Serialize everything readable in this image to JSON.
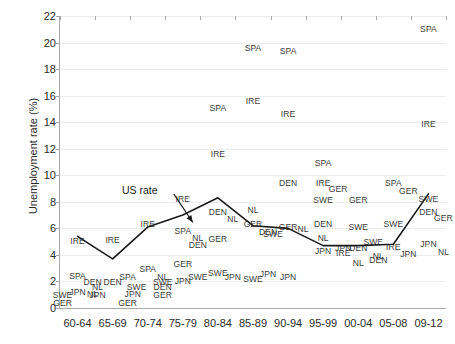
{
  "chart_data": {
    "type": "scatter",
    "title": "",
    "xlabel": "",
    "ylabel": "Unemployment rate (%)",
    "ylim": [
      0,
      22
    ],
    "ytick_step": 2,
    "yticks": [
      0,
      2,
      4,
      6,
      8,
      10,
      12,
      14,
      16,
      18,
      20,
      22
    ],
    "grid": true,
    "legend": "none",
    "categories": [
      "60-64",
      "65-69",
      "70-74",
      "75-79",
      "80-84",
      "85-89",
      "90-94",
      "95-99",
      "00-04",
      "05-08",
      "09-12"
    ],
    "annotations": [
      {
        "text": "US rate",
        "x_category": "70-74",
        "y": 8.9
      }
    ],
    "series": [
      {
        "name": "US rate",
        "type": "line",
        "color": "#1a1a1a",
        "values": [
          5.4,
          3.7,
          6.1,
          7.0,
          8.3,
          6.2,
          6.0,
          4.7,
          4.7,
          4.8,
          8.6
        ]
      },
      {
        "name": "IRE",
        "type": "scatter",
        "values": [
          5.1,
          5.2,
          6.4,
          8.2,
          11.6,
          15.6,
          14.6,
          9.4,
          4.4,
          4.6,
          13.9
        ]
      },
      {
        "name": "SPA",
        "type": "scatter",
        "values": [
          2.4,
          2.3,
          3.0,
          5.8,
          15.1,
          19.6,
          19.4,
          19.3,
          10.9,
          9.5,
          21.0
        ]
      },
      {
        "name": "GER",
        "type": "scatter",
        "values": [
          0.6,
          0.7,
          0.9,
          3.3,
          5.2,
          6.3,
          5.8,
          9.0,
          9.1,
          9.4,
          7.4
        ]
      },
      {
        "name": "DEN",
        "type": "scatter",
        "values": [
          2.0,
          1.9,
          1.5,
          5.3,
          7.2,
          6.0,
          9.4,
          6.3,
          5.0,
          3.9,
          7.2
        ]
      },
      {
        "name": "NL",
        "type": "scatter",
        "values": [
          0.9,
          1.6,
          2.2,
          5.5,
          7.0,
          7.4,
          6.1,
          5.3,
          3.4,
          4.0,
          5.2
        ]
      },
      {
        "name": "JPN",
        "type": "scatter",
        "values": [
          1.2,
          1.2,
          1.3,
          2.0,
          2.4,
          2.6,
          2.3,
          3.9,
          4.9,
          4.1,
          4.6
        ]
      },
      {
        "name": "SWE",
        "type": "scatter",
        "values": [
          1.1,
          1.8,
          2.2,
          1.9,
          2.6,
          2.2,
          6.7,
          8.9,
          6.1,
          6.4,
          8.2
        ]
      }
    ],
    "point_labels": [
      {
        "label": "IRE",
        "cat": 0,
        "y": 5.05
      },
      {
        "label": "SPA",
        "cat": 0,
        "y": 2.4
      },
      {
        "label": "DEN",
        "cat": 0,
        "y": 1.95
      },
      {
        "label": "JPN",
        "cat": 0,
        "y": 1.2
      },
      {
        "label": "NL",
        "cat": 0,
        "y": 1.05
      },
      {
        "label": "SWE",
        "cat": 0,
        "y": 0.95
      },
      {
        "label": "GER",
        "cat": 0,
        "y": 0.35
      },
      {
        "label": "IRE",
        "cat": 1,
        "y": 5.15
      },
      {
        "label": "DEN",
        "cat": 1,
        "y": 1.95
      },
      {
        "label": "SPA",
        "cat": 1,
        "y": 2.3
      },
      {
        "label": "NL",
        "cat": 1,
        "y": 1.55
      },
      {
        "label": "SWE",
        "cat": 1,
        "y": 1.55
      },
      {
        "label": "JPN",
        "cat": 1,
        "y": 0.95
      },
      {
        "label": "GER",
        "cat": 1,
        "y": 0.35
      },
      {
        "label": "IRE",
        "cat": 2,
        "y": 6.35
      },
      {
        "label": "SPA",
        "cat": 2,
        "y": 2.95
      },
      {
        "label": "NL",
        "cat": 2,
        "y": 2.35
      },
      {
        "label": "SWE",
        "cat": 2,
        "y": 1.95
      },
      {
        "label": "DEN",
        "cat": 2,
        "y": 1.55
      },
      {
        "label": "GER",
        "cat": 2,
        "y": 0.95
      },
      {
        "label": "JPN",
        "cat": 2,
        "y": 1.05
      },
      {
        "label": "SPA",
        "cat": 3,
        "y": 5.8
      },
      {
        "label": "NL",
        "cat": 3,
        "y": 5.25
      },
      {
        "label": "DEN",
        "cat": 3,
        "y": 4.75
      },
      {
        "label": "GER",
        "cat": 3,
        "y": 3.3
      },
      {
        "label": "JPN",
        "cat": 3,
        "y": 2.0
      },
      {
        "label": "SWE",
        "cat": 3,
        "y": 2.35
      },
      {
        "label": "IRE",
        "cat": 3,
        "y": 8.25
      },
      {
        "label": "SPA",
        "cat": 4,
        "y": 15.1
      },
      {
        "label": "IRE",
        "cat": 4,
        "y": 11.6
      },
      {
        "label": "DEN",
        "cat": 4,
        "y": 7.2
      },
      {
        "label": "NL",
        "cat": 4,
        "y": 6.7
      },
      {
        "label": "GER",
        "cat": 4,
        "y": 5.2
      },
      {
        "label": "SWE",
        "cat": 4,
        "y": 2.6
      },
      {
        "label": "JPN",
        "cat": 4,
        "y": 2.3
      },
      {
        "label": "SPA",
        "cat": 5,
        "y": 19.6
      },
      {
        "label": "IRE",
        "cat": 5,
        "y": 15.6
      },
      {
        "label": "NL",
        "cat": 5,
        "y": 7.4
      },
      {
        "label": "GER",
        "cat": 5,
        "y": 6.3
      },
      {
        "label": "DEN",
        "cat": 5,
        "y": 5.7
      },
      {
        "label": "SWE",
        "cat": 5,
        "y": 2.2
      },
      {
        "label": "JPN",
        "cat": 5,
        "y": 2.55
      },
      {
        "label": "SPA",
        "cat": 6,
        "y": 19.4
      },
      {
        "label": "IRE",
        "cat": 6,
        "y": 14.6
      },
      {
        "label": "DEN",
        "cat": 6,
        "y": 9.4
      },
      {
        "label": "GER",
        "cat": 6,
        "y": 6.1
      },
      {
        "label": "NL",
        "cat": 6,
        "y": 5.95
      },
      {
        "label": "SWE",
        "cat": 6,
        "y": 5.6
      },
      {
        "label": "JPN",
        "cat": 6,
        "y": 2.3
      },
      {
        "label": "IRE",
        "cat": 7,
        "y": 9.4
      },
      {
        "label": "GER",
        "cat": 7,
        "y": 8.95
      },
      {
        "label": "SWE",
        "cat": 7,
        "y": 8.15
      },
      {
        "label": "DEN",
        "cat": 7,
        "y": 6.35
      },
      {
        "label": "NL",
        "cat": 7,
        "y": 5.3
      },
      {
        "label": "JPN",
        "cat": 7,
        "y": 4.3
      },
      {
        "label": "SPA",
        "cat": 7,
        "y": 10.9
      },
      {
        "label": "GER",
        "cat": 8,
        "y": 8.15
      },
      {
        "label": "SWE",
        "cat": 8,
        "y": 6.1
      },
      {
        "label": "DEN",
        "cat": 8,
        "y": 4.55
      },
      {
        "label": "SWE2",
        "cat": 8,
        "y": 4.95
      },
      {
        "label": "JPN",
        "cat": 8,
        "y": 4.55
      },
      {
        "label": "IRE",
        "cat": 8,
        "y": 4.15
      },
      {
        "label": "NL",
        "cat": 8,
        "y": 3.4
      },
      {
        "label": "SPA",
        "cat": 9,
        "y": 9.45
      },
      {
        "label": "GER",
        "cat": 9,
        "y": 8.8
      },
      {
        "label": "SWE",
        "cat": 9,
        "y": 6.35
      },
      {
        "label": "IRE",
        "cat": 9,
        "y": 4.6
      },
      {
        "label": "JPN",
        "cat": 9,
        "y": 4.05
      },
      {
        "label": "NL",
        "cat": 9,
        "y": 3.95
      },
      {
        "label": "DEN",
        "cat": 9,
        "y": 3.6
      },
      {
        "label": "SPA",
        "cat": 10,
        "y": 21.0
      },
      {
        "label": "IRE",
        "cat": 10,
        "y": 13.9
      },
      {
        "label": "SWE",
        "cat": 10,
        "y": 8.2
      },
      {
        "label": "DEN",
        "cat": 10,
        "y": 7.25
      },
      {
        "label": "GER",
        "cat": 10,
        "y": 6.75
      },
      {
        "label": "JPN",
        "cat": 10,
        "y": 4.85
      },
      {
        "label": "NL",
        "cat": 10,
        "y": 4.25
      }
    ]
  }
}
